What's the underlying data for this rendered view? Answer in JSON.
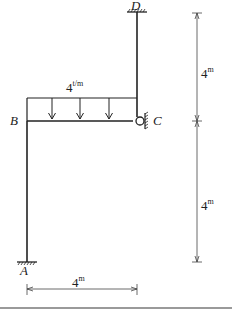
{
  "diagram": {
    "type": "structural-frame",
    "nodes": {
      "A": {
        "label": "A",
        "support": "fixed"
      },
      "B": {
        "label": "B",
        "support": "none"
      },
      "C": {
        "label": "C",
        "support": "roller"
      },
      "D": {
        "label": "D",
        "support": "fixed"
      }
    },
    "load": {
      "value": "4",
      "unit": "t/m",
      "type": "uniformly-distributed",
      "member": "BC"
    },
    "dimensions": {
      "horizontal": {
        "value": "4",
        "unit": "m"
      },
      "vertical_upper": {
        "value": "4",
        "unit": "m"
      },
      "vertical_lower": {
        "value": "4",
        "unit": "m"
      }
    },
    "colors": {
      "line": "#222222",
      "dimension_line": "#444444",
      "rule": "#9a9a9a"
    }
  }
}
